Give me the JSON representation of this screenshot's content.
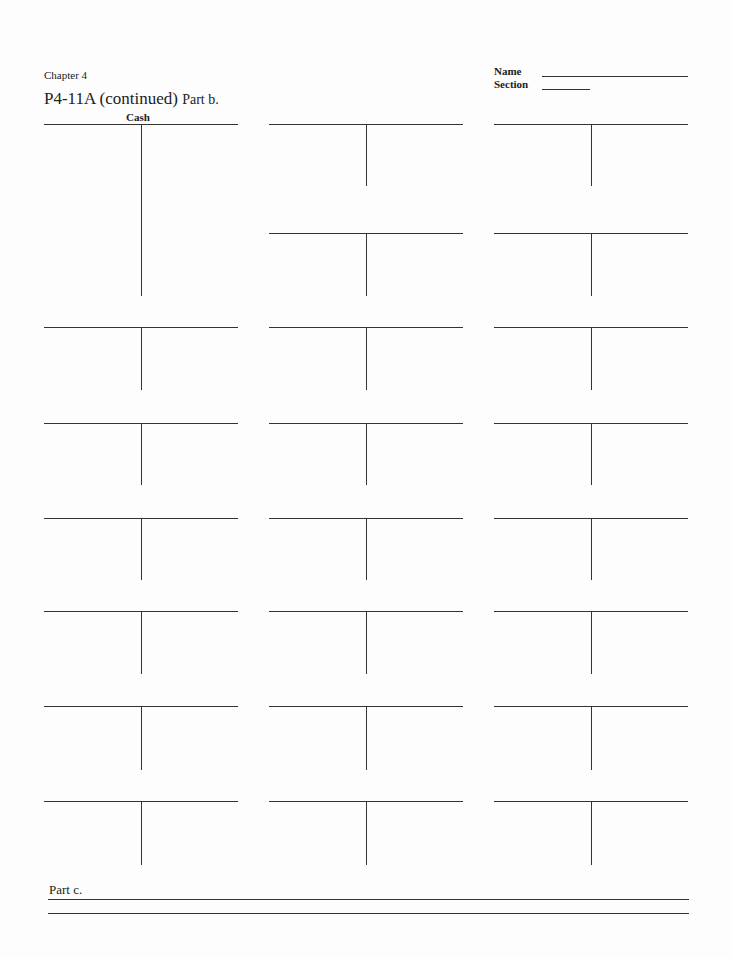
{
  "header": {
    "chapter": "Chapter 4",
    "name_label": "Name",
    "section_label": "Section",
    "title_main": "P4-11A (continued)",
    "title_part": "Part b."
  },
  "t_accounts": {
    "first_account_label": "Cash",
    "columns_x": [
      44,
      269,
      494
    ],
    "accounts": [
      {
        "col": 0,
        "top": 124,
        "height": 172,
        "label": "Cash"
      },
      {
        "col": 1,
        "top": 124,
        "height": 62,
        "label": ""
      },
      {
        "col": 2,
        "top": 124,
        "height": 62,
        "label": ""
      },
      {
        "col": 1,
        "top": 233,
        "height": 63,
        "label": ""
      },
      {
        "col": 2,
        "top": 233,
        "height": 63,
        "label": ""
      },
      {
        "col": 0,
        "top": 327,
        "height": 63,
        "label": ""
      },
      {
        "col": 1,
        "top": 327,
        "height": 63,
        "label": ""
      },
      {
        "col": 2,
        "top": 327,
        "height": 63,
        "label": ""
      },
      {
        "col": 0,
        "top": 423,
        "height": 62,
        "label": ""
      },
      {
        "col": 1,
        "top": 423,
        "height": 62,
        "label": ""
      },
      {
        "col": 2,
        "top": 423,
        "height": 62,
        "label": ""
      },
      {
        "col": 0,
        "top": 518,
        "height": 62,
        "label": ""
      },
      {
        "col": 1,
        "top": 518,
        "height": 62,
        "label": ""
      },
      {
        "col": 2,
        "top": 518,
        "height": 62,
        "label": ""
      },
      {
        "col": 0,
        "top": 611,
        "height": 63,
        "label": ""
      },
      {
        "col": 1,
        "top": 611,
        "height": 63,
        "label": ""
      },
      {
        "col": 2,
        "top": 611,
        "height": 63,
        "label": ""
      },
      {
        "col": 0,
        "top": 706,
        "height": 64,
        "label": ""
      },
      {
        "col": 1,
        "top": 706,
        "height": 64,
        "label": ""
      },
      {
        "col": 2,
        "top": 706,
        "height": 64,
        "label": ""
      },
      {
        "col": 0,
        "top": 801,
        "height": 64,
        "label": ""
      },
      {
        "col": 1,
        "top": 801,
        "height": 64,
        "label": ""
      },
      {
        "col": 2,
        "top": 801,
        "height": 64,
        "label": ""
      }
    ]
  },
  "part_c": {
    "label": "Part c."
  }
}
